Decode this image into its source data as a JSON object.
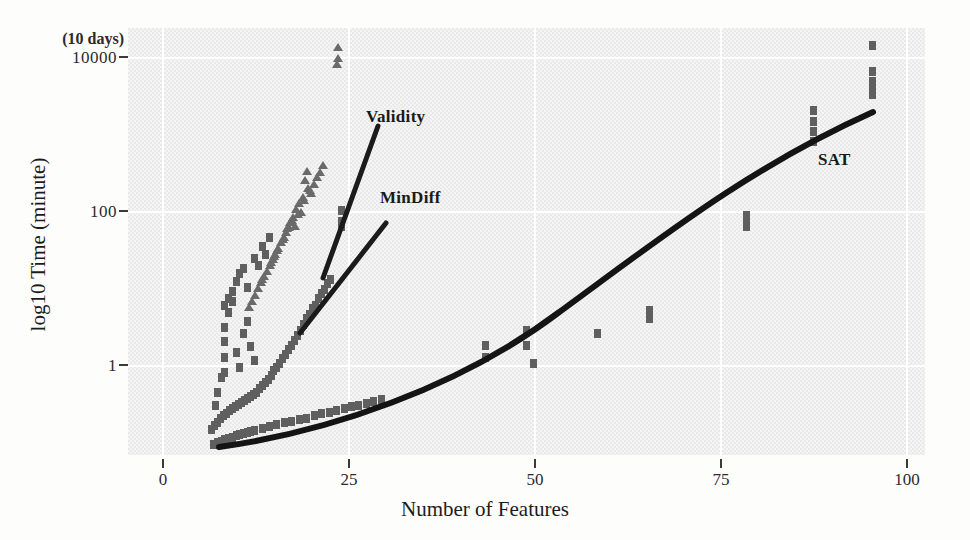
{
  "figure": {
    "xtitle": "Number of Features",
    "ytitle": "log10 Time (minute)",
    "annotation_top": "(10 days)"
  },
  "chart_data": {
    "type": "scatter",
    "title": "",
    "xlabel": "Number of Features",
    "ylabel": "log10 Time (minute)",
    "xlim": [
      -3,
      104
    ],
    "ylim_log10": [
      -0.75,
      4.35
    ],
    "yscale": "log10",
    "xticks": [
      0,
      25,
      50,
      75,
      100
    ],
    "xticklabels": [
      "0",
      "25",
      "50",
      "75",
      "100"
    ],
    "yticks": [
      1,
      100,
      10000
    ],
    "yticklabels": [
      "1",
      "100",
      "10000"
    ],
    "grid": true,
    "grid_color": "#ffffff",
    "panel_background": "#e9e9e9",
    "annotations": [
      {
        "text": "(10 days)",
        "x": 0,
        "y": 10000,
        "note": "above the 10000 tick on y axis"
      }
    ],
    "legend_position": "inline-labels",
    "series": [
      {
        "name": "Validity",
        "marker": "triangle",
        "color": "#6a6a6a",
        "label_position": {
          "x": 22.5,
          "y": 1100
        },
        "trend": "steep straight line in log space",
        "points": [
          [
            25.2,
            13000
          ],
          [
            25.2,
            9500
          ],
          [
            25.0,
            8200
          ],
          [
            21.0,
            430
          ],
          [
            20.8,
            330
          ],
          [
            21.2,
            270
          ],
          [
            20.5,
            210
          ],
          [
            20.0,
            175
          ],
          [
            19.6,
            150
          ],
          [
            19.2,
            120
          ],
          [
            18.8,
            105
          ],
          [
            18.4,
            88
          ],
          [
            18.0,
            70
          ],
          [
            17.6,
            60
          ],
          [
            17.2,
            52
          ],
          [
            16.8,
            44
          ],
          [
            16.4,
            38
          ],
          [
            16.0,
            32
          ],
          [
            15.6,
            27
          ],
          [
            19.4,
            95
          ],
          [
            20.2,
            140
          ],
          [
            21.6,
            230
          ],
          [
            22.0,
            300
          ],
          [
            22.4,
            360
          ],
          [
            18.2,
            80
          ],
          [
            17.0,
            48
          ],
          [
            16.2,
            35
          ],
          [
            15.2,
            24
          ],
          [
            14.8,
            20
          ],
          [
            14.4,
            17
          ],
          [
            19.0,
            110
          ],
          [
            20.6,
            190
          ],
          [
            21.4,
            250
          ],
          [
            17.8,
            66
          ],
          [
            16.6,
            41
          ],
          [
            15.0,
            22
          ],
          [
            14.0,
            14
          ],
          [
            13.6,
            12
          ],
          [
            13.2,
            10
          ],
          [
            18.6,
            92
          ],
          [
            19.8,
            130
          ],
          [
            22.8,
            420
          ],
          [
            23.2,
            500
          ]
        ]
      },
      {
        "name": "MinDiff",
        "marker": "square",
        "color": "#5f5f5f",
        "label_position": {
          "x": 26.8,
          "y": 115
        },
        "trend": "moderate straight line in log space",
        "points": [
          [
            25.6,
            150
          ],
          [
            25.6,
            110
          ],
          [
            25.6,
            95
          ],
          [
            24.2,
            22
          ],
          [
            23.8,
            20
          ],
          [
            23.4,
            17
          ],
          [
            23.0,
            15
          ],
          [
            22.6,
            13
          ],
          [
            22.2,
            11
          ],
          [
            21.8,
            10
          ],
          [
            21.4,
            8.5
          ],
          [
            21.0,
            7.5
          ],
          [
            20.6,
            6.5
          ],
          [
            20.2,
            5.5
          ],
          [
            19.8,
            4.8
          ],
          [
            19.4,
            4.2
          ],
          [
            19.0,
            3.6
          ],
          [
            18.6,
            3.2
          ],
          [
            18.2,
            2.8
          ],
          [
            17.8,
            2.5
          ],
          [
            17.4,
            2.2
          ],
          [
            17.0,
            2.0
          ],
          [
            16.6,
            1.8
          ],
          [
            16.2,
            1.6
          ],
          [
            15.8,
            1.4
          ],
          [
            15.4,
            1.3
          ],
          [
            15.0,
            1.2
          ],
          [
            14.6,
            1.1
          ],
          [
            14.2,
            1.0
          ],
          [
            13.8,
            0.95
          ],
          [
            13.4,
            0.9
          ],
          [
            13.0,
            0.85
          ],
          [
            12.6,
            0.8
          ],
          [
            12.2,
            0.76
          ],
          [
            11.8,
            0.72
          ],
          [
            11.4,
            0.68
          ],
          [
            11.0,
            0.64
          ],
          [
            10.6,
            0.6
          ],
          [
            10.2,
            0.56
          ],
          [
            9.8,
            0.52
          ],
          [
            9.4,
            0.48
          ],
          [
            9.0,
            0.44
          ],
          [
            8.6,
            0.4
          ],
          [
            8.2,
            0.36
          ],
          [
            10.0,
            6.0
          ],
          [
            10.0,
            4.0
          ],
          [
            10.0,
            2.6
          ],
          [
            10.0,
            1.7
          ],
          [
            10.5,
            9.0
          ],
          [
            11.0,
            12.0
          ],
          [
            11.5,
            3.0
          ],
          [
            12.0,
            2.0
          ],
          [
            12.5,
            5.0
          ],
          [
            13.0,
            7.0
          ],
          [
            13.5,
            3.5
          ],
          [
            14.0,
            2.4
          ],
          [
            9.5,
            1.5
          ],
          [
            9.0,
            1.0
          ],
          [
            8.8,
            0.7
          ],
          [
            12.0,
            26
          ],
          [
            12.5,
            30
          ],
          [
            13.0,
            18
          ],
          [
            14.0,
            40
          ],
          [
            15.0,
            55
          ],
          [
            16.0,
            70
          ],
          [
            11.5,
            21
          ],
          [
            11.0,
            16
          ],
          [
            10.5,
            13
          ],
          [
            10.0,
            11
          ],
          [
            14.5,
            33
          ],
          [
            15.5,
            44
          ]
        ]
      },
      {
        "name": "SAT",
        "marker": "square",
        "color": "#5f5f5f",
        "label_position": {
          "x": 85.5,
          "y": 330
        },
        "trend": "upward-curving smooth fit from x=8 to x=97",
        "points": [
          [
            8.5,
            0.24
          ],
          [
            9.0,
            0.25
          ],
          [
            9.5,
            0.26
          ],
          [
            10.0,
            0.27
          ],
          [
            10.5,
            0.28
          ],
          [
            11.0,
            0.29
          ],
          [
            11.5,
            0.3
          ],
          [
            12.0,
            0.31
          ],
          [
            12.5,
            0.32
          ],
          [
            13.0,
            0.33
          ],
          [
            13.5,
            0.34
          ],
          [
            14.0,
            0.35
          ],
          [
            15.0,
            0.37
          ],
          [
            16.0,
            0.39
          ],
          [
            17.0,
            0.41
          ],
          [
            18.0,
            0.43
          ],
          [
            19.0,
            0.45
          ],
          [
            20.0,
            0.47
          ],
          [
            21.0,
            0.49
          ],
          [
            22.0,
            0.52
          ],
          [
            23.0,
            0.55
          ],
          [
            24.0,
            0.58
          ],
          [
            25.0,
            0.61
          ],
          [
            26.0,
            0.64
          ],
          [
            27.0,
            0.67
          ],
          [
            28.0,
            0.7
          ],
          [
            29.0,
            0.74
          ],
          [
            30.0,
            0.78
          ],
          [
            31.0,
            0.82
          ],
          [
            45.0,
            3.6
          ],
          [
            45.0,
            2.6
          ],
          [
            50.5,
            5.5
          ],
          [
            50.5,
            3.6
          ],
          [
            51.5,
            2.2
          ],
          [
            60.0,
            5.0
          ],
          [
            67.0,
            9.5
          ],
          [
            67.0,
            7.5
          ],
          [
            80.0,
            110
          ],
          [
            80.0,
            95
          ],
          [
            80.0,
            130
          ],
          [
            89.0,
            1700
          ],
          [
            89.0,
            1300
          ],
          [
            89.0,
            1000
          ],
          [
            89.0,
            2300
          ],
          [
            97.0,
            5200
          ],
          [
            97.0,
            4300
          ],
          [
            97.0,
            3600
          ],
          [
            97.0,
            6800
          ],
          [
            97.0,
            14000
          ]
        ]
      }
    ]
  }
}
